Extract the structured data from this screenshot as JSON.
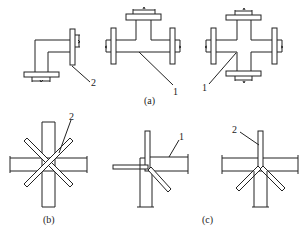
{
  "figure": {
    "panels": [
      {
        "id": "a",
        "caption": "(a)",
        "parts": [
          "elbow",
          "tee",
          "cross"
        ]
      },
      {
        "id": "b",
        "caption": "(b)"
      },
      {
        "id": "c",
        "caption": "(c)"
      }
    ],
    "callouts": {
      "elbow": "2",
      "tee": "1",
      "cross": "1",
      "b": "2",
      "c_left": "1",
      "c_right": "2"
    }
  }
}
